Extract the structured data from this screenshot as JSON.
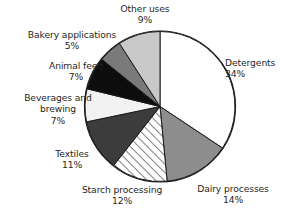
{
  "chart_data": {
    "type": "pie",
    "title": "",
    "subtitle": "",
    "xlabel": "",
    "ylabel": "",
    "grid": false,
    "legend_position": "none",
    "units": "percent",
    "total": 100,
    "start_angle_deg": 0,
    "direction": "clockwise",
    "categories": [
      "Detergents",
      "Dairy processes",
      "Starch processing",
      "Textiles",
      "Beverages and brewing",
      "Animal feed",
      "Bakery applications",
      "Other uses"
    ],
    "values": [
      34,
      14,
      12,
      11,
      7,
      7,
      5,
      9
    ],
    "slices": [
      {
        "name": "Detergents",
        "value": 34,
        "value_label": "34%",
        "fill": "#ffffff",
        "pattern": "solid",
        "label_line1": "Detergents",
        "label_line2": "",
        "label_pct": "34%"
      },
      {
        "name": "Dairy processes",
        "value": 14,
        "value_label": "14%",
        "fill": "#8d8d8d",
        "pattern": "solid",
        "label_line1": "Dairy processes",
        "label_line2": "",
        "label_pct": "14%"
      },
      {
        "name": "Starch processing",
        "value": 12,
        "value_label": "12%",
        "fill": "#ffffff",
        "pattern": "diagonal-hatch",
        "label_line1": "Starch processing",
        "label_line2": "",
        "label_pct": "12%"
      },
      {
        "name": "Textiles",
        "value": 11,
        "value_label": "11%",
        "fill": "#3c3c3c",
        "pattern": "solid",
        "label_line1": "Textiles",
        "label_line2": "",
        "label_pct": "11%"
      },
      {
        "name": "Beverages and brewing",
        "value": 7,
        "value_label": "7%",
        "fill": "#f2f2f2",
        "pattern": "solid",
        "label_line1": "Beverages and",
        "label_line2": "brewing",
        "label_pct": "7%"
      },
      {
        "name": "Animal feed",
        "value": 7,
        "value_label": "7%",
        "fill": "#0d0d0d",
        "pattern": "solid",
        "label_line1": "Animal feed",
        "label_line2": "",
        "label_pct": "7%"
      },
      {
        "name": "Bakery applications",
        "value": 5,
        "value_label": "5%",
        "fill": "#7a7a7a",
        "pattern": "solid",
        "label_line1": "Bakery applications",
        "label_line2": "",
        "label_pct": "5%"
      },
      {
        "name": "Other uses",
        "value": 9,
        "value_label": "9%",
        "fill": "#c9c9c9",
        "pattern": "solid",
        "label_line1": "Other uses",
        "label_line2": "",
        "label_pct": "9%"
      }
    ],
    "outline_color": "#1a1a1a",
    "background": "#ffffff"
  }
}
